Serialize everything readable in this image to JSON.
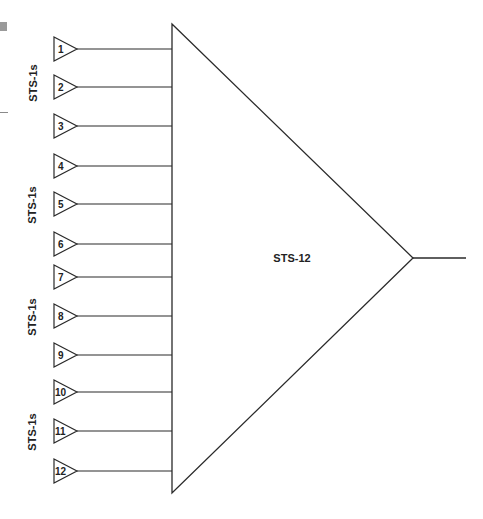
{
  "diagram": {
    "colors": {
      "stroke": "#2a2a2a",
      "text": "#222222",
      "edge_mark": "#9a9a9a"
    },
    "multiplexer": {
      "label": "STS-12",
      "label_pos": [
        292,
        258
      ],
      "base_x": 172,
      "top_y": 24,
      "bottom_y": 493,
      "apex": [
        413,
        258
      ],
      "output_end_x": 466
    },
    "groups": [
      {
        "label": "STS-1s",
        "pos": [
          33,
          83
        ]
      },
      {
        "label": "STS-1s",
        "pos": [
          32,
          205
        ]
      },
      {
        "label": "STS-1s",
        "pos": [
          32,
          317
        ]
      },
      {
        "label": "STS-1s",
        "pos": [
          32,
          432
        ]
      }
    ],
    "inputs": [
      {
        "label": "1",
        "y": 49
      },
      {
        "label": "2",
        "y": 87
      },
      {
        "label": "3",
        "y": 126
      },
      {
        "label": "4",
        "y": 166
      },
      {
        "label": "5",
        "y": 204
      },
      {
        "label": "6",
        "y": 244
      },
      {
        "label": "7",
        "y": 277
      },
      {
        "label": "8",
        "y": 316
      },
      {
        "label": "9",
        "y": 355
      },
      {
        "label": "10",
        "y": 392
      },
      {
        "label": "11",
        "y": 431
      },
      {
        "label": "12",
        "y": 471
      }
    ]
  }
}
